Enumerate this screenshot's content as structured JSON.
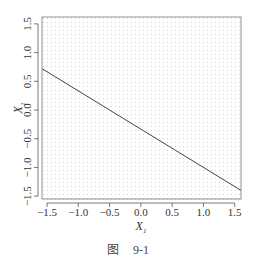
{
  "chart_data": {
    "type": "line",
    "title": "",
    "xlabel": "X1",
    "ylabel": "X2",
    "xlim": [
      -1.58,
      1.6
    ],
    "ylim": [
      -1.55,
      1.62
    ],
    "x_ticks": [
      -1.5,
      -1.0,
      -0.5,
      0.0,
      0.5,
      1.0,
      1.5
    ],
    "x_tick_labels": [
      "−1.5",
      "−1.0",
      "−0.5",
      "0.0",
      "0.5",
      "1.0",
      "1.5"
    ],
    "y_ticks": [
      -1.5,
      -1.0,
      -0.5,
      0.0,
      0.5,
      1.0,
      1.5
    ],
    "y_tick_labels": [
      "−1.5",
      "−1.0",
      "−0.5",
      "0.0",
      "0.5",
      "1.0",
      "1.5"
    ],
    "grid": "dotted background",
    "legend": null,
    "series": [
      {
        "name": "hyperplane 1 + 2X1 + 3X2 = 0",
        "equation": "X2 = -1/3 - (2/3) X1",
        "x": [
          -1.58,
          1.6
        ],
        "y": [
          0.72,
          -1.4
        ]
      }
    ]
  },
  "axes": {
    "xlabel_main": "X",
    "xlabel_sub": "1",
    "ylabel_main": "X",
    "ylabel_sub": "2"
  },
  "caption": {
    "prefix": "图",
    "number": "9-1"
  },
  "colors": {
    "line": "#444444",
    "axis": "#555555",
    "dots": "#c8c8c8"
  }
}
